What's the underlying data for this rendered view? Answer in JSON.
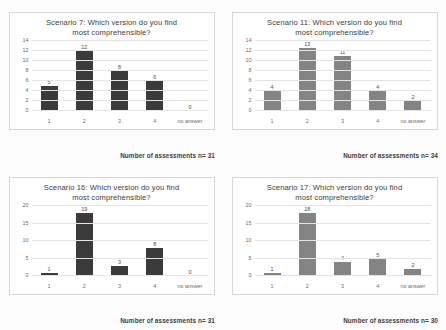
{
  "page": {
    "background": "#fdfdfd",
    "bar_color_dark": "#3b3b3b",
    "bar_color_gray": "#848484",
    "gridline_color": "#e4e4e4"
  },
  "charts": [
    {
      "id": "scenario-7",
      "title_line1": "Scenario 7: Which version do you find",
      "title_line2": "most comprehensible?",
      "footer": "Number of assessments n= 31",
      "bar_style": "dark",
      "chart_data": {
        "type": "bar",
        "title": "Scenario 7: Which version do you find most comprehensible?",
        "categories": [
          "1",
          "2",
          "3",
          "4",
          "no answer"
        ],
        "values": [
          5,
          12,
          8,
          6,
          0
        ],
        "value_labels": [
          "5",
          "12",
          "8",
          "6",
          "0"
        ],
        "xlabel": "",
        "ylabel": "",
        "ylim": [
          0,
          14
        ],
        "yticks": [
          0,
          2,
          4,
          6,
          8,
          10,
          12,
          14
        ],
        "ytick_labels": [
          "0",
          "2",
          "4",
          "6",
          "8",
          "10",
          "12",
          "14"
        ],
        "grid": true,
        "legend": "none",
        "annotation": "Number of assessments n= 31"
      }
    },
    {
      "id": "scenario-11",
      "title_line1": "Scenario 11: Which version do you find",
      "title_line2": "most comprehensible?",
      "footer": "Number of assessments n= 34",
      "bar_style": "gray",
      "chart_data": {
        "type": "bar",
        "title": "Scenario 11: Which version do you find most comprehensible?",
        "categories": [
          "1",
          "2",
          "3",
          "4",
          "no answer"
        ],
        "values": [
          4,
          13,
          11,
          4,
          2
        ],
        "value_labels": [
          "4",
          "13",
          "11",
          "4",
          "2"
        ],
        "xlabel": "",
        "ylabel": "",
        "ylim": [
          0,
          14
        ],
        "yticks": [
          0,
          2,
          4,
          6,
          8,
          10,
          12,
          14
        ],
        "ytick_labels": [
          "0",
          "2",
          "4",
          "6",
          "8",
          "10",
          "12",
          "14"
        ],
        "grid": true,
        "legend": "none",
        "annotation": "Number of assessments n= 34"
      }
    },
    {
      "id": "scenario-16",
      "title_line1": "Scenario 16: Which version do you find",
      "title_line2": "most comprehensible?",
      "footer": "Number of assessments n= 31",
      "bar_style": "dark",
      "chart_data": {
        "type": "bar",
        "title": "Scenario 16: Which version do you find most comprehensible?",
        "categories": [
          "1",
          "2",
          "3",
          "4",
          "no answer"
        ],
        "values": [
          1,
          19,
          3,
          8,
          0
        ],
        "value_labels": [
          "1",
          "19",
          "3",
          "8",
          "0"
        ],
        "xlabel": "",
        "ylabel": "",
        "ylim": [
          0,
          20
        ],
        "yticks": [
          0,
          5,
          10,
          15,
          20
        ],
        "ytick_labels": [
          "0",
          "5",
          "10",
          "15",
          "20"
        ],
        "grid": true,
        "legend": "none",
        "annotation": "Number of assessments n= 31"
      }
    },
    {
      "id": "scenario-17",
      "title_line1": "Scenario 17: Which version do you find",
      "title_line2": "most comprehensible?",
      "footer": "Number of assessments n= 30",
      "bar_style": "gray",
      "chart_data": {
        "type": "bar",
        "title": "Scenario 17: Which version do you find most comprehensible?",
        "categories": [
          "1",
          "2",
          "3",
          "4",
          "no answer"
        ],
        "values": [
          1,
          18,
          4,
          5,
          2
        ],
        "value_labels": [
          "1",
          "18",
          "4",
          "5",
          "2"
        ],
        "xlabel": "",
        "ylabel": "",
        "ylim": [
          0,
          20
        ],
        "yticks": [
          0,
          5,
          10,
          15,
          20
        ],
        "ytick_labels": [
          "0",
          "5",
          "10",
          "15",
          "20"
        ],
        "grid": true,
        "legend": "none",
        "annotation": "Number of assessments n= 30"
      }
    }
  ]
}
